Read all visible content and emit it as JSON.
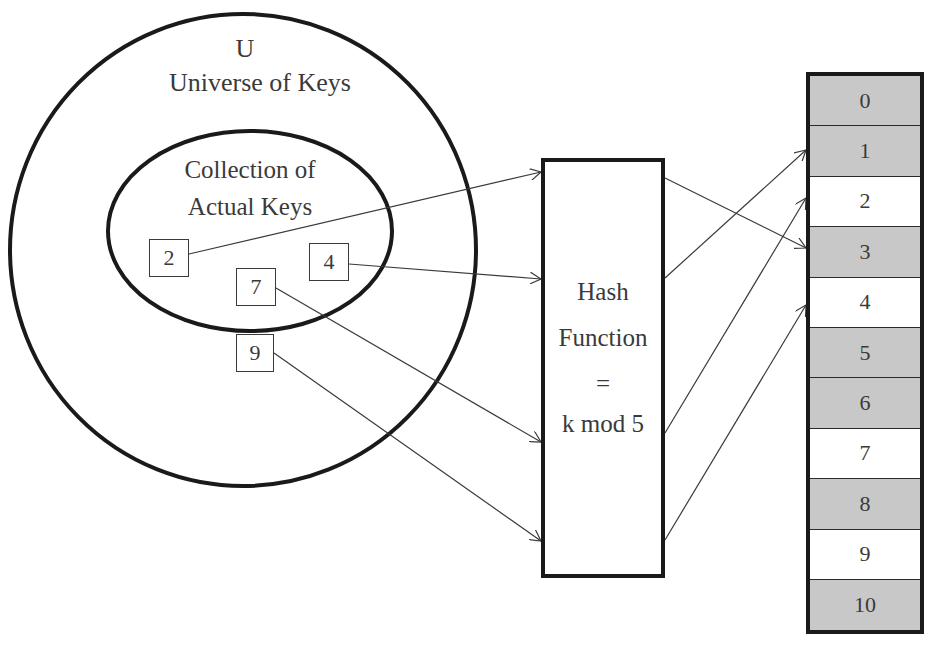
{
  "universe": {
    "symbol": "U",
    "title": "Universe of Keys"
  },
  "actual_keys": {
    "title_line1": "Collection of",
    "title_line2": "Actual Keys",
    "keys": [
      {
        "value": "2",
        "x": 149,
        "y": 239,
        "w": 40,
        "h": 38
      },
      {
        "value": "4",
        "x": 309,
        "y": 243,
        "w": 40,
        "h": 38
      },
      {
        "value": "7",
        "x": 236,
        "y": 268,
        "w": 40,
        "h": 38
      },
      {
        "value": "9",
        "x": 236,
        "y": 334,
        "w": 38,
        "h": 38
      }
    ]
  },
  "hash_function": {
    "line1": "Hash",
    "line2": "Function",
    "line3": "=",
    "line4": "k mod 5"
  },
  "hash_table": {
    "slots": [
      {
        "index": "0",
        "color": "#c8c8c8"
      },
      {
        "index": "1",
        "color": "#c8c8c8"
      },
      {
        "index": "2",
        "color": "#ffffff"
      },
      {
        "index": "3",
        "color": "#c8c8c8"
      },
      {
        "index": "4",
        "color": "#ffffff"
      },
      {
        "index": "5",
        "color": "#c8c8c8"
      },
      {
        "index": "6",
        "color": "#c8c8c8"
      },
      {
        "index": "7",
        "color": "#ffffff"
      },
      {
        "index": "8",
        "color": "#c8c8c8"
      },
      {
        "index": "9",
        "color": "#ffffff"
      },
      {
        "index": "10",
        "color": "#c8c8c8"
      }
    ]
  },
  "colors": {
    "stroke": "#1a1a1a",
    "text": "#3a3a3a",
    "filled_slot": "#c8c8c8",
    "empty_slot": "#ffffff"
  }
}
